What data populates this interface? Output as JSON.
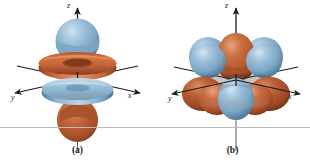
{
  "figure": {
    "background_color": "#ffffff",
    "width": 310,
    "height": 167,
    "separator_color": "#b9b9b9"
  },
  "colors": {
    "lobe_blue": "#86b0cd",
    "lobe_blue_light": "#b6d2e4",
    "lobe_blue_dark": "#4f7e9e",
    "lobe_orange": "#c2613a",
    "lobe_orange_light": "#e09a72",
    "lobe_orange_dark": "#8c3c1e",
    "axis": "#1a1a1a",
    "label": "#1a1a1a"
  },
  "panels": [
    {
      "id": "a",
      "caption": "(a)",
      "orbital_name": "d-z-squared-orbital",
      "axes": {
        "z": "z",
        "x": "x",
        "y": "y"
      },
      "lobes": [
        {
          "name": "top-sphere",
          "color": "blue"
        },
        {
          "name": "upper-torus",
          "color": "orange"
        },
        {
          "name": "lower-disc",
          "color": "blue"
        },
        {
          "name": "bottom-lobe",
          "color": "orange"
        }
      ]
    },
    {
      "id": "b",
      "caption": "(b)",
      "orbital_name": "multi-lobe-d-orbital",
      "axes": {
        "z": "z",
        "x": "x",
        "y": "y"
      },
      "lobes": [
        {
          "name": "upper-left-lobe",
          "color": "blue"
        },
        {
          "name": "upper-center-lobe",
          "color": "orange"
        },
        {
          "name": "upper-right-lobe",
          "color": "blue"
        },
        {
          "name": "lower-left-lobe",
          "color": "orange"
        },
        {
          "name": "lower-center-lobe",
          "color": "blue"
        },
        {
          "name": "lower-right-lobe",
          "color": "orange"
        }
      ]
    }
  ]
}
